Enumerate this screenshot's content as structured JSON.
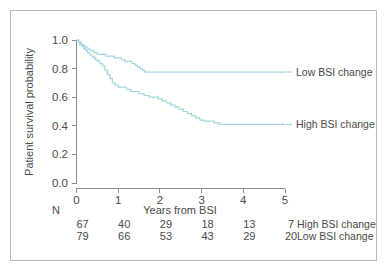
{
  "figure": {
    "background_color": "#ffffff",
    "frame_color": "#b9b9b9",
    "axis_color": "#8d8d8d",
    "text_color": "#4a4a4a"
  },
  "chart_data": {
    "type": "line",
    "title": "",
    "subtitle": "",
    "xlabel": "Years from BSI",
    "ylabel": "Patient survival probability",
    "xlim": [
      0,
      5
    ],
    "ylim": [
      0.0,
      1.0
    ],
    "xticks": [
      0,
      1,
      2,
      3,
      4,
      5
    ],
    "xtick_labels": [
      "0",
      "1",
      "2",
      "3",
      "4",
      "5"
    ],
    "yticks": [
      0.0,
      0.2,
      0.4,
      0.6,
      0.8,
      1.0
    ],
    "ytick_labels": [
      "0.0",
      "0.2",
      "0.4",
      "0.6",
      "0.8",
      "1.0"
    ],
    "grid": false,
    "legend_position": "inline-right",
    "line_color": "#a6d4e2",
    "series": [
      {
        "name": "Low BSI change",
        "color": "#a6d4e2",
        "label_x": 4.15,
        "label_y": 0.776,
        "points": [
          [
            0.0,
            1.0
          ],
          [
            0.06,
            0.987
          ],
          [
            0.1,
            0.975
          ],
          [
            0.14,
            0.962
          ],
          [
            0.2,
            0.95
          ],
          [
            0.27,
            0.937
          ],
          [
            0.34,
            0.925
          ],
          [
            0.42,
            0.912
          ],
          [
            0.5,
            0.9
          ],
          [
            0.6,
            0.9
          ],
          [
            0.7,
            0.887
          ],
          [
            0.82,
            0.887
          ],
          [
            0.9,
            0.875
          ],
          [
            1.0,
            0.875
          ],
          [
            1.08,
            0.862
          ],
          [
            1.16,
            0.85
          ],
          [
            1.24,
            0.85
          ],
          [
            1.32,
            0.837
          ],
          [
            1.4,
            0.825
          ],
          [
            1.46,
            0.812
          ],
          [
            1.52,
            0.8
          ],
          [
            1.58,
            0.788
          ],
          [
            1.64,
            0.776
          ],
          [
            1.72,
            0.776
          ],
          [
            5.0,
            0.776
          ]
        ]
      },
      {
        "name": "High BSI change",
        "color": "#a6d4e2",
        "label_x": 4.15,
        "label_y": 0.41,
        "points": [
          [
            0.0,
            1.0
          ],
          [
            0.04,
            0.985
          ],
          [
            0.08,
            0.97
          ],
          [
            0.12,
            0.955
          ],
          [
            0.17,
            0.94
          ],
          [
            0.22,
            0.925
          ],
          [
            0.27,
            0.91
          ],
          [
            0.32,
            0.895
          ],
          [
            0.38,
            0.88
          ],
          [
            0.44,
            0.865
          ],
          [
            0.5,
            0.85
          ],
          [
            0.56,
            0.835
          ],
          [
            0.62,
            0.82
          ],
          [
            0.68,
            0.79
          ],
          [
            0.74,
            0.76
          ],
          [
            0.8,
            0.73
          ],
          [
            0.86,
            0.7
          ],
          [
            0.92,
            0.685
          ],
          [
            1.0,
            0.67
          ],
          [
            1.12,
            0.67
          ],
          [
            1.2,
            0.655
          ],
          [
            1.3,
            0.64
          ],
          [
            1.42,
            0.64
          ],
          [
            1.5,
            0.625
          ],
          [
            1.62,
            0.612
          ],
          [
            1.74,
            0.6
          ],
          [
            1.86,
            0.6
          ],
          [
            1.96,
            0.588
          ],
          [
            2.06,
            0.575
          ],
          [
            2.16,
            0.56
          ],
          [
            2.26,
            0.545
          ],
          [
            2.36,
            0.53
          ],
          [
            2.46,
            0.515
          ],
          [
            2.56,
            0.5
          ],
          [
            2.66,
            0.485
          ],
          [
            2.76,
            0.47
          ],
          [
            2.86,
            0.455
          ],
          [
            2.96,
            0.44
          ],
          [
            3.06,
            0.432
          ],
          [
            3.2,
            0.432
          ],
          [
            3.3,
            0.421
          ],
          [
            3.42,
            0.41
          ],
          [
            5.0,
            0.41
          ]
        ]
      }
    ]
  },
  "risk_table": {
    "header_label": "N",
    "columns": [
      "0",
      "1",
      "2",
      "3",
      "4",
      "5"
    ],
    "rows": [
      {
        "label": "High BSI change",
        "values": [
          "67",
          "40",
          "29",
          "18",
          "13",
          "7"
        ]
      },
      {
        "label": "Low BSI change",
        "values": [
          "79",
          "66",
          "53",
          "43",
          "29",
          "20"
        ]
      }
    ]
  }
}
